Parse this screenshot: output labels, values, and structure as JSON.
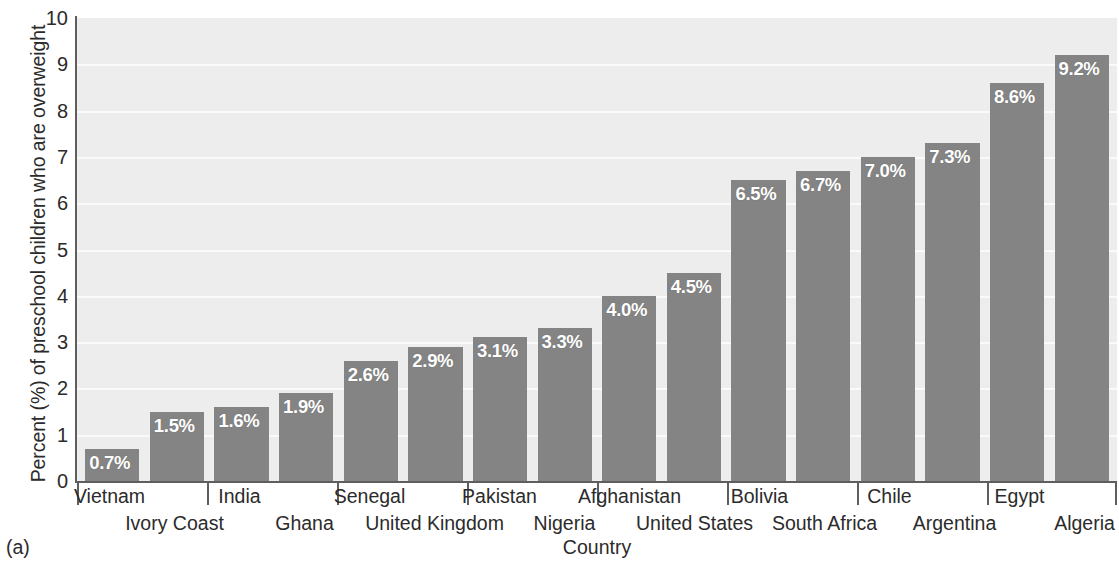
{
  "figure": {
    "panel_label": "(a)",
    "bottom_cut_text": ""
  },
  "chart_data": {
    "type": "bar",
    "title": "",
    "xlabel": "Country",
    "ylabel": "Percent (%) of preschool children who are overweight",
    "ylim": [
      0,
      10
    ],
    "ytick_labels": [
      "0",
      "1",
      "2",
      "3",
      "4",
      "5",
      "6",
      "7",
      "8",
      "9",
      "10"
    ],
    "ytick_values": [
      0,
      1,
      2,
      3,
      4,
      5,
      6,
      7,
      8,
      9,
      10
    ],
    "grid": true,
    "legend": "none",
    "orientation": "vertical",
    "bar_color": "#848484",
    "plot_background": "#ededed",
    "value_label_color": "#ffffff",
    "categories": [
      "Vietnam",
      "Ivory Coast",
      "India",
      "Ghana",
      "Senegal",
      "United Kingdom",
      "Pakistan",
      "Nigeria",
      "Afghanistan",
      "United States",
      "Bolivia",
      "South Africa",
      "Chile",
      "Argentina",
      "Egypt",
      "Algeria"
    ],
    "values": [
      0.7,
      1.5,
      1.6,
      1.9,
      2.6,
      2.9,
      3.1,
      3.3,
      4.0,
      4.5,
      6.5,
      6.7,
      7.0,
      7.3,
      8.6,
      9.2
    ],
    "value_labels": [
      "0.7%",
      "1.5%",
      "1.6%",
      "1.9%",
      "2.6%",
      "2.9%",
      "3.1%",
      "3.3%",
      "4.0%",
      "4.5%",
      "6.5%",
      "6.7%",
      "7.0%",
      "7.3%",
      "8.6%",
      "9.2%"
    ]
  }
}
